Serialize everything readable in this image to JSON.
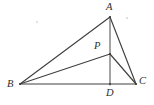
{
  "figure": {
    "width": 154,
    "height": 105,
    "background_color": "#ffffff",
    "line_color": "#40403f",
    "label_color": "#2e2e2d",
    "labels": {
      "A": "A",
      "B": "B",
      "C": "C",
      "D": "D",
      "P": "P"
    },
    "points": [
      {
        "name": "A",
        "label": "A",
        "x": 110,
        "y": 17
      },
      {
        "name": "B",
        "label": "B",
        "x": 20,
        "y": 84
      },
      {
        "name": "C",
        "label": "C",
        "x": 136,
        "y": 84
      },
      {
        "name": "D",
        "label": "D",
        "x": 110,
        "y": 84
      },
      {
        "name": "P",
        "label": "P",
        "x": 110,
        "y": 54
      }
    ],
    "segments": [
      {
        "name": "segment-BA",
        "from": "B",
        "to": "A"
      },
      {
        "name": "segment-AC",
        "from": "A",
        "to": "C"
      },
      {
        "name": "segment-BC",
        "from": "B",
        "to": "C"
      },
      {
        "name": "segment-AD",
        "from": "A",
        "to": "D"
      },
      {
        "name": "segment-BP",
        "from": "B",
        "to": "P"
      },
      {
        "name": "segment-PC",
        "from": "P",
        "to": "C"
      }
    ]
  }
}
